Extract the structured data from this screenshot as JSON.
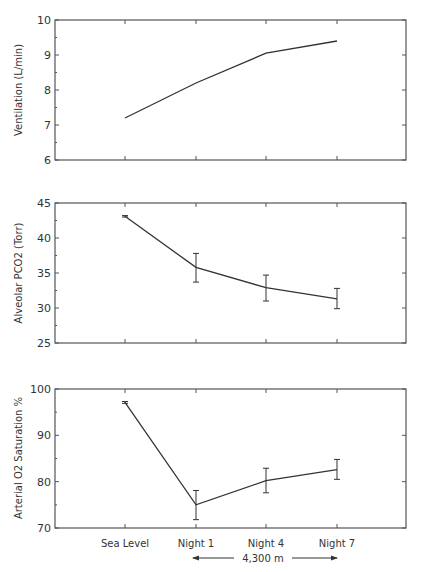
{
  "chart_data": [
    {
      "type": "line",
      "title": "",
      "xlabel": "",
      "ylabel": "Ventilation (L/min)",
      "categories": [
        "Sea Level",
        "Night 1",
        "Night 4",
        "Night 7"
      ],
      "ylim": [
        6,
        10
      ],
      "yticks": [
        6,
        7,
        8,
        9,
        10
      ],
      "grid": false,
      "series": [
        {
          "name": "Ventilation",
          "values": [
            7.2,
            8.2,
            9.05,
            9.4
          ],
          "error_low": null,
          "error_high": null
        }
      ]
    },
    {
      "type": "line",
      "title": "",
      "xlabel": "",
      "ylabel": "Alveolar PCO2 (Torr)",
      "categories": [
        "Sea Level",
        "Night 1",
        "Night 4",
        "Night 7"
      ],
      "ylim": [
        25,
        45
      ],
      "yticks": [
        25,
        30,
        35,
        40,
        45
      ],
      "grid": false,
      "series": [
        {
          "name": "Alveolar PCO2",
          "values": [
            43.1,
            35.8,
            32.9,
            31.3
          ],
          "error_low": [
            43.0,
            33.7,
            31.0,
            29.9
          ],
          "error_high": [
            43.2,
            37.8,
            34.7,
            32.8
          ]
        }
      ]
    },
    {
      "type": "line",
      "title": "",
      "xlabel": "",
      "ylabel": "Arterial O2 Saturation %",
      "categories": [
        "Sea Level",
        "Night 1",
        "Night 4",
        "Night 7"
      ],
      "ylim": [
        70,
        100
      ],
      "yticks": [
        70,
        80,
        90,
        100
      ],
      "grid": false,
      "series": [
        {
          "name": "Arterial O2 Saturation",
          "values": [
            97.1,
            75.0,
            80.2,
            82.6
          ],
          "error_low": [
            96.9,
            71.8,
            77.6,
            80.5
          ],
          "error_high": [
            97.3,
            78.1,
            82.9,
            84.8
          ]
        }
      ]
    }
  ],
  "x_axis": {
    "labels": [
      "Sea Level",
      "Night 1",
      "Night 4",
      "Night 7"
    ],
    "altitude_annotation": "4,300 m",
    "altitude_span": [
      "Night 1",
      "Night 7"
    ]
  }
}
